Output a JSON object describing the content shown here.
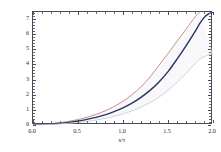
{
  "chart_data": {
    "type": "line",
    "title": "",
    "subtitle": "",
    "xlabel": "s/τ",
    "ylabel": "h in μm",
    "xlim": [
      0.0,
      2.0
    ],
    "ylim": [
      0.0,
      7.45
    ],
    "grid": false,
    "legend": "none",
    "frame": true,
    "xticks": [
      "0.0",
      "0.5",
      "1.0",
      "1.5",
      "2.0"
    ],
    "xtick_values": [
      0.0,
      0.5,
      1.0,
      1.5,
      2.0
    ],
    "xminor_values": [
      0.1,
      0.2,
      0.3,
      0.4,
      0.6,
      0.7,
      0.8,
      0.9,
      1.1,
      1.2,
      1.3,
      1.4,
      1.6,
      1.7,
      1.8,
      1.9
    ],
    "yticks": [
      "0",
      "1",
      "2",
      "3",
      "4",
      "5",
      "6",
      "7"
    ],
    "ytick_values": [
      0,
      1,
      2,
      3,
      4,
      5,
      6,
      7
    ],
    "yminor_values": [
      0.2,
      0.4,
      0.6,
      0.8,
      1.2,
      1.4,
      1.6,
      1.8,
      2.2,
      2.4,
      2.6,
      2.8,
      3.2,
      3.4,
      3.6,
      3.8,
      4.2,
      4.4,
      4.6,
      4.8,
      5.2,
      5.4,
      5.6,
      5.8,
      6.2,
      6.4,
      6.6,
      6.8,
      7.2,
      7.4
    ],
    "x": [
      0.0,
      0.1,
      0.2,
      0.3,
      0.4,
      0.5,
      0.6,
      0.7,
      0.8,
      0.9,
      1.0,
      1.1,
      1.2,
      1.3,
      1.4,
      1.5,
      1.6,
      1.7,
      1.8,
      1.85,
      1.9,
      1.95,
      2.0
    ],
    "series": [
      {
        "name": "upper-curve",
        "color": "#c87a72",
        "width": 0.85,
        "values": [
          0.0,
          0.035,
          0.085,
          0.15,
          0.24,
          0.36,
          0.51,
          0.7,
          0.93,
          1.22,
          1.57,
          2.0,
          2.52,
          3.16,
          3.94,
          4.72,
          5.52,
          6.32,
          7.12,
          7.45,
          null,
          null,
          null
        ]
      },
      {
        "name": "middle-curve",
        "color": "#2e3566",
        "width": 1.45,
        "values": [
          0.0,
          0.025,
          0.062,
          0.11,
          0.175,
          0.26,
          0.37,
          0.5,
          0.67,
          0.88,
          1.13,
          1.44,
          1.82,
          2.28,
          2.84,
          3.52,
          4.34,
          5.22,
          6.16,
          6.66,
          7.08,
          7.32,
          7.45
        ]
      },
      {
        "name": "lower-curve",
        "color": "#bcd4d4",
        "width": 0.85,
        "values": [
          0.0,
          0.015,
          0.038,
          0.07,
          0.112,
          0.167,
          0.237,
          0.325,
          0.434,
          0.568,
          0.732,
          0.932,
          1.175,
          1.472,
          1.835,
          2.28,
          2.81,
          3.4,
          4.02,
          4.33,
          4.5,
          4.62,
          4.7
        ]
      }
    ],
    "band_fill": "#f3f0f4",
    "background": "#ffffff",
    "axis_color": "#4a4a58"
  }
}
